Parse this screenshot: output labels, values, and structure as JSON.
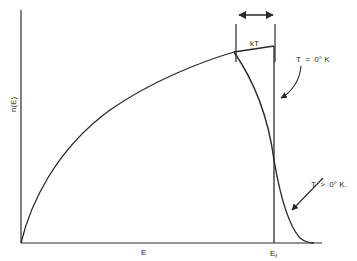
{
  "diagram": {
    "title": "",
    "axes": {
      "y_label": "n(E)",
      "x_label": "E",
      "x_marker_label": "E",
      "x_marker_subscript": "f"
    },
    "annotations": {
      "width_label": "kT",
      "zero_temp_label": "T  =  0° K",
      "finite_temp_label": "T  >  0° K."
    },
    "colors": {
      "line": "#2a2a2a",
      "background": "#ffffff"
    }
  }
}
